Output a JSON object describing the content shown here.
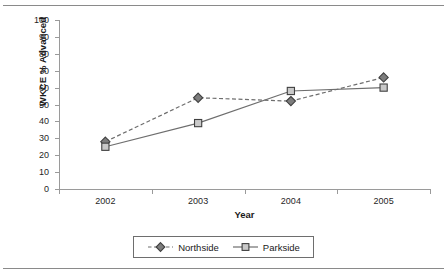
{
  "chart_data": {
    "type": "line",
    "title": "",
    "subtitle": "",
    "xlabel": "Year",
    "ylabel": "WKCE % Advanced",
    "categories": [
      "2002",
      "2003",
      "2004",
      "2005"
    ],
    "series": [
      {
        "name": "Northside",
        "values": [
          28,
          54,
          52,
          66
        ],
        "marker": "diamond",
        "line_style": "dashed",
        "color": "#6e6e6e",
        "marker_fill": "#7d7d7d",
        "marker_stroke": "#404040"
      },
      {
        "name": "Parkside",
        "values": [
          25,
          39,
          58,
          60
        ],
        "marker": "square",
        "line_style": "solid",
        "color": "#6e6e6e",
        "marker_fill": "#c9c9c9",
        "marker_stroke": "#404040"
      }
    ],
    "ylim": [
      0,
      100
    ],
    "ytick_step": 10,
    "yticks": [
      "0",
      "10",
      "20",
      "30",
      "40",
      "50",
      "60",
      "70",
      "80",
      "90",
      "100"
    ],
    "grid": false,
    "legend_position": "bottom",
    "axis_color": "#9a9a9a",
    "background": "#ffffff"
  },
  "legend": {
    "entries": [
      {
        "label": "Northside"
      },
      {
        "label": "Parkside"
      }
    ]
  }
}
